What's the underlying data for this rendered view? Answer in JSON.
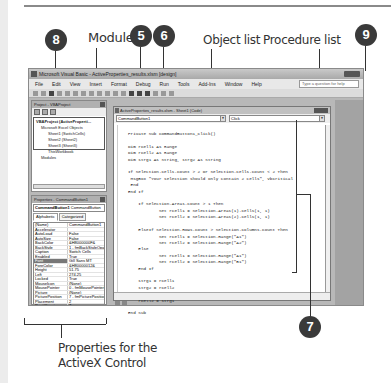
{
  "callouts": {
    "c8": "8",
    "c5": "5",
    "c6": "6",
    "c9": "9",
    "c7": "7"
  },
  "labels": {
    "module": "Module",
    "object_list": "Object list",
    "procedure_list": "Procedure list",
    "properties_line1": "Properties for the",
    "properties_line2": "ActiveX Control"
  },
  "window": {
    "title": "Microsoft Visual Basic - ActiveProperties_results.xlsm [design]",
    "help_placeholder": "Type a question for help",
    "menu": [
      "File",
      "Edit",
      "View",
      "Insert",
      "Format",
      "Debug",
      "Run",
      "Tools",
      "Add-Ins",
      "Window",
      "Help"
    ]
  },
  "project_pane": {
    "title": "Project - VBAProject",
    "tree": [
      "VBAProject (ActiveProperti...",
      "Microsoft Excel Objects",
      "Sheet1 (SwitchCells)",
      "Sheet2 (Sheet2)",
      "Sheet3 (Sheet3)",
      "ThisWorkbook",
      "Modules"
    ]
  },
  "properties_pane": {
    "title": "Properties - CommandButton1",
    "selector_name": "CommandButton1",
    "selector_type": "CommandButton",
    "tabs": [
      "Alphabetic",
      "Categorized"
    ],
    "rows": [
      {
        "k": "(Name)",
        "v": "CommandButton1"
      },
      {
        "k": "Accelerator",
        "v": ""
      },
      {
        "k": "AutoLoad",
        "v": "False"
      },
      {
        "k": "AutoSize",
        "v": "False"
      },
      {
        "k": "BackColor",
        "v": "&H8000000F&"
      },
      {
        "k": "BackStyle",
        "v": "1 - fmBackStyleOpaque"
      },
      {
        "k": "Caption",
        "v": "Switch Cells"
      },
      {
        "k": "Enabled",
        "v": "True"
      },
      {
        "k": "Font",
        "v": "Gill Sans MT"
      },
      {
        "k": "ForeColor",
        "v": "&H80000012&"
      },
      {
        "k": "Height",
        "v": "51.75"
      },
      {
        "k": "Left",
        "v": "274.25"
      },
      {
        "k": "Locked",
        "v": "True"
      },
      {
        "k": "MouseIcon",
        "v": "(None)"
      },
      {
        "k": "MousePointer",
        "v": "0 - fmMousePointerDefault"
      },
      {
        "k": "Picture",
        "v": "(None)"
      },
      {
        "k": "PicturePosition",
        "v": "7 - fmPicturePositionAboveCenter"
      },
      {
        "k": "Placement",
        "v": "2"
      },
      {
        "k": "PrintObject",
        "v": "True"
      },
      {
        "k": "Shadow",
        "v": "False"
      }
    ]
  },
  "code_window": {
    "title": "ActiveProperties_results.xlsm - Sheet1 (Code)",
    "object_combo": "CommandButton1",
    "procedure_combo": "Click",
    "code": "Private Sub CommandButton1_Click()\n\nDim rCell1 As Range\nDim rCell2 As Range\nDim strg1 As String, strg2 As String\n\nIf Selection.Cells.Count > 2 Or Selection.Cells.Count < 2 Then\n MsgBox \"Your selection should only contain 2 cells\", vbCritical\n End\nEnd If\n\n    If Selection.Areas.Count > 1 Then\n            Set rCell1 = Selection.Areas(1).Cells(1, 1)\n            Set rCell2 = Selection.Areas(2).Cells(1, 1)\n\n    ElseIf Selection.Rows.Count > Selection.Columns.Count Then\n            Set rCell1 = Selection.Range(\"A1\")\n            Set rCell2 = Selection.Range(\"A2\")\n    Else\n            Set rCell1 = Selection.Range(\"A1\")\n            Set rCell2 = Selection.Range(\"B1\")\n    End If\n\n    strg1 = rCell1\n    strg2 = rCell2\n    rCell1 = strg2\n    rCell2 = strg1\n\nEnd Sub"
  }
}
